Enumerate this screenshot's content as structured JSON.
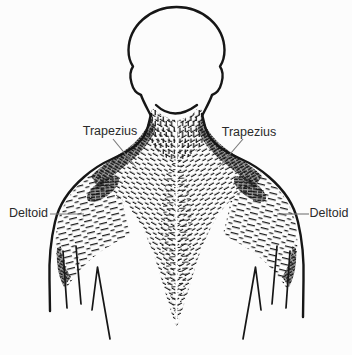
{
  "colors": {
    "ink": "#161616",
    "background": "#fcfcfc",
    "leader_line": "#7a7a7a",
    "label_text": "#2a2a2a"
  },
  "labels": {
    "trapezius_left": "Trapezius",
    "trapezius_right": "Trapezius",
    "deltoid_left": "Deltoid",
    "deltoid_right": "Deltoid"
  }
}
